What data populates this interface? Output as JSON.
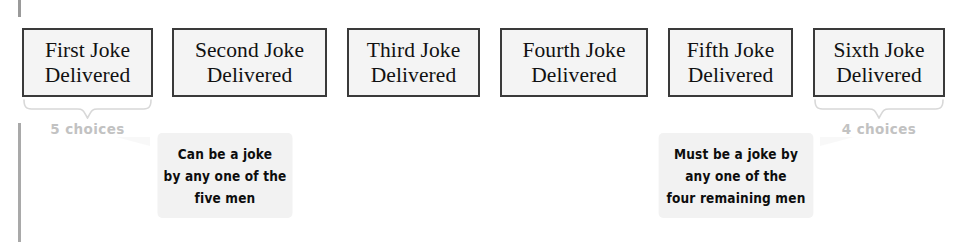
{
  "diagram": {
    "boxes": [
      {
        "name": "first-joke",
        "line1": "First Joke",
        "line2": "Delivered",
        "x": 22,
        "width": 131
      },
      {
        "name": "second-joke",
        "line1": "Second Joke",
        "line2": "Delivered",
        "x": 172,
        "width": 155
      },
      {
        "name": "third-joke",
        "line1": "Third Joke",
        "line2": "Delivered",
        "x": 347,
        "width": 133
      },
      {
        "name": "fourth-joke",
        "line1": "Fourth Joke",
        "line2": "Delivered",
        "x": 500,
        "width": 148
      },
      {
        "name": "fifth-joke",
        "line1": "Fifth Joke",
        "line2": "Delivered",
        "x": 668,
        "width": 125
      },
      {
        "name": "sixth-joke",
        "line1": "Sixth Joke",
        "line2": "Delivered",
        "x": 813,
        "width": 132
      }
    ],
    "braces": [
      {
        "name": "brace-first",
        "x": 22,
        "width": 131,
        "label": "5 choices",
        "label_x": 22,
        "label_width": 131,
        "label_y": 121
      },
      {
        "name": "brace-sixth",
        "x": 813,
        "width": 132,
        "label": "4 choices",
        "label_x": 813,
        "label_width": 132,
        "label_y": 121
      }
    ],
    "callouts": [
      {
        "name": "callout-first-joke",
        "x": 150,
        "y": 133,
        "width": 150,
        "height": 85,
        "tail_side": "left",
        "tail_x": 116,
        "tail_y": 137,
        "lines": [
          "Can be a joke",
          "by any one of the",
          "five men"
        ]
      },
      {
        "name": "callout-sixth-joke",
        "x": 650,
        "y": 133,
        "width": 172,
        "height": 85,
        "tail_side": "right",
        "tail_x": 820,
        "tail_y": 137,
        "lines": [
          "Must be a joke by",
          "any one of the",
          "four remaining men"
        ]
      }
    ],
    "colors": {
      "box_fill": "#f4f4f4",
      "box_border": "#3a3a3a",
      "brace": "#d8d8d8",
      "choice_label": "#c2c2c2",
      "callout_bg": "#f2f2f2",
      "text": "#111111",
      "margin_rule": "#a9a9a9"
    }
  }
}
